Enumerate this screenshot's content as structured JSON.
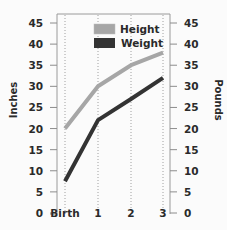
{
  "chart_data": {
    "type": "line",
    "title": "",
    "xlabel": "Age (years)",
    "ylabel": "Inches",
    "ylabel_right": "Pounds",
    "categories": [
      "Birth",
      "1",
      "2",
      "3"
    ],
    "x": [
      0,
      1,
      2,
      3
    ],
    "ylim": [
      0,
      45
    ],
    "yticks": [
      0,
      5,
      10,
      15,
      20,
      25,
      30,
      35,
      40,
      45
    ],
    "ylim_right": [
      0,
      45
    ],
    "yticks_right": [
      0,
      5,
      10,
      15,
      20,
      25,
      30,
      35,
      40,
      45
    ],
    "grid": "vertical dotted lines at each x category",
    "legend_position": "upper center inside plot",
    "series": [
      {
        "name": "Height",
        "axis": "left (Inches)",
        "color": "#a6a6a6",
        "values": [
          20,
          30,
          35,
          38
        ]
      },
      {
        "name": "Weight",
        "axis": "right (Pounds)",
        "color": "#333333",
        "values": [
          7.5,
          22,
          27,
          32
        ]
      }
    ]
  },
  "legend": {
    "height_label": "Height",
    "weight_label": "Weight"
  },
  "axes": {
    "left_title": "Inches",
    "right_title": "Pounds",
    "x_title": "Age (years)",
    "x_ticks": [
      "Birth",
      "1",
      "2",
      "3"
    ],
    "left_ticks": [
      "45",
      "40",
      "35",
      "30",
      "25",
      "20",
      "15",
      "10",
      "5",
      "0"
    ],
    "right_ticks": [
      "45",
      "40",
      "35",
      "30",
      "25",
      "20",
      "15",
      "10",
      "5",
      "0"
    ]
  }
}
